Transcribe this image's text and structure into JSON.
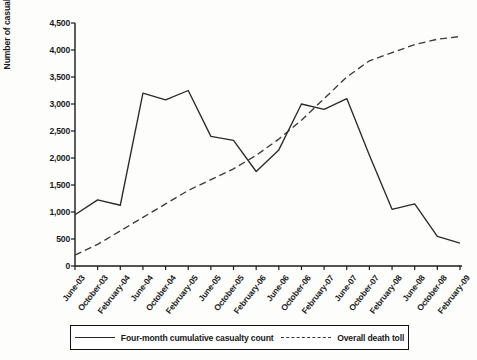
{
  "axes": {
    "ylabel": "Number of casualties",
    "yticks": [
      "0",
      "500",
      "1,000",
      "1,500",
      "2,000",
      "2,500",
      "3,000",
      "3,500",
      "4,000",
      "4,500"
    ],
    "xticks": [
      "June-03",
      "October-03",
      "February-04",
      "June-04",
      "October-04",
      "February-05",
      "June-05",
      "October-05",
      "February-06",
      "June-06",
      "October-06",
      "February-07",
      "June-07",
      "October-07",
      "February-08",
      "June-08",
      "October-08",
      "February-09"
    ]
  },
  "legend": {
    "series1_label": "Four-month cumulative casualty count",
    "series2_label": "Overall death toll",
    "series1_style": "solid-line",
    "series2_style": "dashed-line"
  },
  "colors": {
    "line": "#2a2a2a",
    "axis": "#1a1a1a",
    "background": "#fdfdfc"
  },
  "chart_data": {
    "type": "line",
    "title": "",
    "xlabel": "",
    "ylabel": "Number of casualties",
    "ylim": [
      0,
      4500
    ],
    "ytick_values": [
      0,
      500,
      1000,
      1500,
      2000,
      2500,
      3000,
      3500,
      4000,
      4500
    ],
    "grid": false,
    "legend_position": "bottom",
    "categories": [
      "June-03",
      "October-03",
      "February-04",
      "June-04",
      "October-04",
      "February-05",
      "June-05",
      "October-05",
      "February-06",
      "June-06",
      "October-06",
      "February-07",
      "June-07",
      "October-07",
      "February-08",
      "June-08",
      "October-08",
      "February-09"
    ],
    "series": [
      {
        "name": "Four-month cumulative casualty count",
        "style": "solid",
        "values": [
          950,
          1225,
          1125,
          3200,
          3075,
          3250,
          2400,
          2325,
          1750,
          2150,
          3000,
          2900,
          3100,
          2050,
          1050,
          1150,
          550,
          425
        ]
      },
      {
        "name": "Overall death toll",
        "style": "dashed",
        "values": [
          200,
          400,
          650,
          900,
          1150,
          1400,
          1600,
          1800,
          2050,
          2350,
          2700,
          3100,
          3500,
          3800,
          3950,
          4100,
          4200,
          4250
        ]
      }
    ]
  }
}
